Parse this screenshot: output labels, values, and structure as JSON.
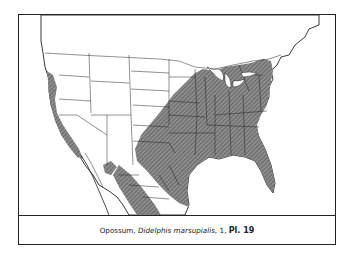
{
  "figure": {
    "type": "range-map",
    "region": "North America (United States, southern Canada, Mexico)",
    "legend": {
      "shaded_area": "Range of species",
      "hatch_color": "#7a7a7a",
      "line_color": "#222222",
      "background_color": "#ffffff"
    },
    "caption": {
      "common_name": "Opossum,",
      "scientific_name": "Didelphis marsupialis,",
      "number": "1,",
      "plate_label": "Pl. 19"
    }
  }
}
